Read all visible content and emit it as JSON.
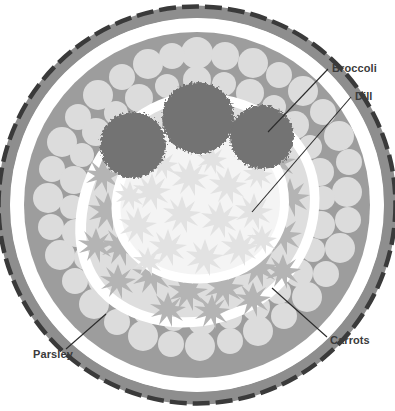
{
  "figure": {
    "background_color": "#ffffff",
    "width": 395,
    "height": 411
  },
  "palette": {
    "background": "#ffffff",
    "rim_dash_dark": "#3a3a3a",
    "rim_band_gray": "#8e8e8e",
    "parsley_bed": "#9d9d9d",
    "parsley_blob": "#dcdcdc",
    "carrot_bed": "#dedede",
    "carrot_burst": "#b4b4b4",
    "dill_bed": "#f4f4f4",
    "dill_burst": "#e2e2e2",
    "broccoli": "#737373",
    "separator_white": "#ffffff",
    "label_text": "#3b3b3b",
    "leader_line": "#2b2b2b"
  },
  "labels": [
    {
      "id": "broccoli",
      "text": "Broccoli",
      "text_x": 332,
      "text_y": 72,
      "anchor": "start",
      "leader_from_x": 328,
      "leader_from_y": 69,
      "leader_to_x": 268,
      "leader_to_y": 132,
      "describes": "dark bumpy florets in the centre-top of the platter"
    },
    {
      "id": "dill",
      "text": "Dill",
      "text_x": 355,
      "text_y": 100,
      "anchor": "start",
      "leader_from_x": 351,
      "leader_from_y": 97,
      "leader_to_x": 252,
      "leader_to_y": 212,
      "describes": "pale starburst sprigs filling the inner circle"
    },
    {
      "id": "carrots",
      "text": "Carrots",
      "text_x": 330,
      "text_y": 344,
      "anchor": "start",
      "leader_from_x": 327,
      "leader_from_y": 337,
      "leader_to_x": 272,
      "leader_to_y": 288,
      "describes": "mid-grey starburst ring between dill and parsley"
    },
    {
      "id": "parsley",
      "text": "Parsley",
      "text_x": 33,
      "text_y": 358,
      "anchor": "start",
      "leader_from_x": 66,
      "leader_from_y": 349,
      "leader_to_x": 106,
      "leader_to_y": 314,
      "describes": "light clustered blobs forming the outer ring"
    }
  ],
  "regions": [
    {
      "id": "rim",
      "name": "Outer rim of the platter",
      "color": "#8e8e8e"
    },
    {
      "id": "parsley-ring",
      "name": "Parsley ring",
      "color": "#9d9d9d"
    },
    {
      "id": "carrot-ring",
      "name": "Carrot ring",
      "color": "#b4b4b4"
    },
    {
      "id": "dill-center",
      "name": "Dill centre",
      "color": "#e2e2e2"
    },
    {
      "id": "broccoli-florets",
      "name": "Broccoli florets",
      "color": "#737373"
    }
  ],
  "broccoli_florets": [
    {
      "cx": 133,
      "cy": 145,
      "r": 33
    },
    {
      "cx": 198,
      "cy": 118,
      "r": 36
    },
    {
      "cx": 262,
      "cy": 137,
      "r": 32
    }
  ]
}
